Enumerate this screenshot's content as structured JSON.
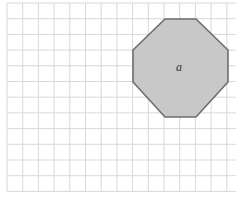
{
  "diagram": {
    "type": "grid-with-polygon",
    "grid": {
      "origin_px": [
        7,
        3
      ],
      "cell_px": 15.7,
      "columns": 15,
      "rows": 12,
      "line_color": "#d8d8d8"
    },
    "shape": {
      "kind": "octagon",
      "label": "a",
      "fill": "#c8c8c8",
      "stroke": "#6e6e6e",
      "vertices_px": [
        [
          165,
          19
        ],
        [
          196,
          19
        ],
        [
          228,
          50
        ],
        [
          228,
          82
        ],
        [
          196,
          117
        ],
        [
          165,
          117
        ],
        [
          133,
          82
        ],
        [
          133,
          50
        ]
      ]
    },
    "label_position_px": [
      176,
      60
    ]
  }
}
